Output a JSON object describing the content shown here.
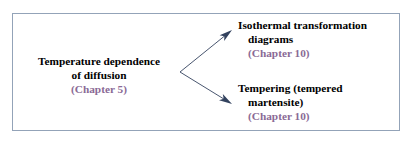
{
  "diagram": {
    "type": "flow-branch",
    "box": {
      "border_color": "#93a3b8",
      "fill_color": "#ffffff"
    },
    "text_color": "#000000",
    "chapter_color": "#8a6a96",
    "arrow_color": "#33425e",
    "source": {
      "id": "temperature-dependence-of-diffusion",
      "line1": "Temperature dependence",
      "line2": "of diffusion",
      "chapter": "(Chapter 5)"
    },
    "targets": [
      {
        "id": "isothermal-transformation-diagrams",
        "line1": "Isothermal transformation",
        "line2": "diagrams",
        "chapter": "(Chapter 10)"
      },
      {
        "id": "tempering-tempered-martensite",
        "line1": "Tempering (tempered",
        "line2": "martensite)",
        "chapter": "(Chapter 10)"
      }
    ],
    "arrows": [
      {
        "id": "arrow-to-isothermal-transformation-diagrams",
        "from_x": 180,
        "from_y": 72,
        "to_x": 232,
        "to_y": 30
      },
      {
        "id": "arrow-to-tempering-tempered-martensite",
        "from_x": 180,
        "from_y": 72,
        "to_x": 232,
        "to_y": 104
      }
    ]
  }
}
